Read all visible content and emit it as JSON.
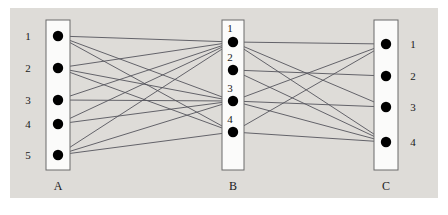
{
  "figure": {
    "background_color": "#dedcd8",
    "canvas_color": "#ffffff",
    "node_color": "#000000",
    "edge_color": "#55555c",
    "box_fill": "#fbfbfa",
    "box_stroke": "#6a6a6a"
  },
  "columns": [
    {
      "id": "A",
      "label": "A",
      "label_position": "bottom",
      "numbers_side": "left",
      "box": {
        "x": 46,
        "y": 20,
        "w": 24,
        "h": 150
      },
      "label_xy": {
        "x": 58,
        "y": 190
      },
      "nodes": [
        {
          "id": "A1",
          "label": "1",
          "cx": 58,
          "cy": 36,
          "lx": 28,
          "ly": 40
        },
        {
          "id": "A2",
          "label": "2",
          "cx": 58,
          "cy": 68,
          "lx": 28,
          "ly": 72
        },
        {
          "id": "A3",
          "label": "3",
          "cx": 58,
          "cy": 100,
          "lx": 28,
          "ly": 104
        },
        {
          "id": "A4",
          "label": "4",
          "cx": 58,
          "cy": 124,
          "lx": 28,
          "ly": 128
        },
        {
          "id": "A5",
          "label": "5",
          "cx": 58,
          "cy": 155,
          "lx": 28,
          "ly": 159
        }
      ]
    },
    {
      "id": "B",
      "label": "B",
      "label_position": "bottom",
      "numbers_side": "above",
      "box": {
        "x": 222,
        "y": 20,
        "w": 22,
        "h": 150
      },
      "label_xy": {
        "x": 233,
        "y": 190
      },
      "nodes": [
        {
          "id": "B1",
          "label": "1",
          "cx": 233,
          "cy": 42,
          "lx": 230,
          "ly": 32
        },
        {
          "id": "B2",
          "label": "2",
          "cx": 233,
          "cy": 70,
          "lx": 230,
          "ly": 61
        },
        {
          "id": "B3",
          "label": "3",
          "cx": 233,
          "cy": 101,
          "lx": 230,
          "ly": 92
        },
        {
          "id": "B4",
          "label": "4",
          "cx": 233,
          "cy": 132,
          "lx": 230,
          "ly": 123
        }
      ]
    },
    {
      "id": "C",
      "label": "C",
      "label_position": "bottom",
      "numbers_side": "right",
      "box": {
        "x": 374,
        "y": 20,
        "w": 24,
        "h": 150
      },
      "label_xy": {
        "x": 386,
        "y": 190
      },
      "nodes": [
        {
          "id": "C1",
          "label": "1",
          "cx": 386,
          "cy": 44,
          "lx": 413,
          "ly": 48
        },
        {
          "id": "C2",
          "label": "2",
          "cx": 386,
          "cy": 76,
          "lx": 413,
          "ly": 80
        },
        {
          "id": "C3",
          "label": "3",
          "cx": 386,
          "cy": 107,
          "lx": 413,
          "ly": 111
        },
        {
          "id": "C4",
          "label": "4",
          "cx": 386,
          "cy": 142,
          "lx": 413,
          "ly": 146
        }
      ]
    }
  ],
  "edges_ab": [
    {
      "from": "A1",
      "to": "B1"
    },
    {
      "from": "A1",
      "to": "B3"
    },
    {
      "from": "A1",
      "to": "B4"
    },
    {
      "from": "A2",
      "to": "B1"
    },
    {
      "from": "A2",
      "to": "B3"
    },
    {
      "from": "A2",
      "to": "B4"
    },
    {
      "from": "A3",
      "to": "B1"
    },
    {
      "from": "A3",
      "to": "B3"
    },
    {
      "from": "A4",
      "to": "B1"
    },
    {
      "from": "A4",
      "to": "B3"
    },
    {
      "from": "A5",
      "to": "B1"
    },
    {
      "from": "A5",
      "to": "B3"
    },
    {
      "from": "A5",
      "to": "B4"
    }
  ],
  "edges_bc": [
    {
      "from": "B1",
      "to": "C3"
    },
    {
      "from": "B1",
      "to": "C4"
    },
    {
      "from": "B1",
      "to": "C1"
    },
    {
      "from": "B2",
      "to": "C2"
    },
    {
      "from": "B2",
      "to": "C4"
    },
    {
      "from": "B3",
      "to": "C1"
    },
    {
      "from": "B3",
      "to": "C3"
    },
    {
      "from": "B3",
      "to": "C4"
    },
    {
      "from": "B4",
      "to": "C1"
    },
    {
      "from": "B4",
      "to": "C4"
    }
  ],
  "geometry": {
    "node_radius": 5.2,
    "edge_width": 0.9,
    "box_stroke_width": 1.0,
    "label_font_size": 11,
    "col_label_font_size": 12,
    "plot_area": {
      "x": 10,
      "y": 8,
      "w": 428,
      "h": 190
    }
  }
}
